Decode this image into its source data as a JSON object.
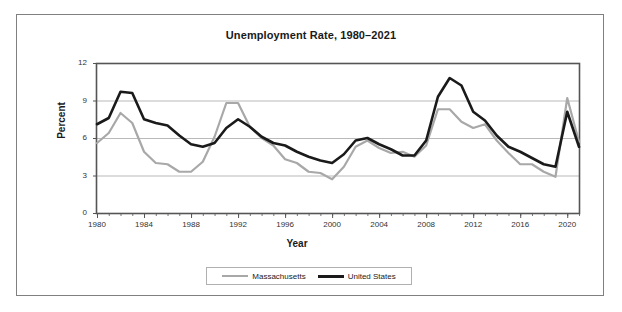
{
  "figure": {
    "title": "Unemployment Rate, 1980–2021",
    "xlabel": "Year",
    "ylabel": "Percent"
  },
  "legend": {
    "entries": [
      {
        "label": "Massachusetts",
        "color": "#a8a8a8"
      },
      {
        "label": "United States",
        "color": "#1a1a1a"
      }
    ]
  },
  "chart_data": {
    "type": "line",
    "title": "Unemployment Rate, 1980–2021",
    "xlabel": "Year",
    "ylabel": "Percent",
    "xlim": [
      1980,
      2021
    ],
    "ylim": [
      0,
      12
    ],
    "yticks": [
      0,
      3,
      6,
      9,
      12
    ],
    "xticks": [
      1980,
      1984,
      1988,
      1992,
      1996,
      2000,
      2004,
      2008,
      2012,
      2016,
      2020
    ],
    "grid": "horizontal",
    "legend_position": "bottom-center",
    "x": [
      1980,
      1981,
      1982,
      1983,
      1984,
      1985,
      1986,
      1987,
      1988,
      1989,
      1990,
      1991,
      1992,
      1993,
      1994,
      1995,
      1996,
      1997,
      1998,
      1999,
      2000,
      2001,
      2002,
      2003,
      2004,
      2005,
      2006,
      2007,
      2008,
      2009,
      2010,
      2011,
      2012,
      2013,
      2014,
      2015,
      2016,
      2017,
      2018,
      2019,
      2020,
      2021
    ],
    "series": [
      {
        "name": "Massachusetts",
        "color": "#a8a8a8",
        "values": [
          5.6,
          6.4,
          8.0,
          7.2,
          4.9,
          4.0,
          3.9,
          3.3,
          3.3,
          4.1,
          6.1,
          8.8,
          8.8,
          6.9,
          6.0,
          5.4,
          4.3,
          4.0,
          3.3,
          3.2,
          2.7,
          3.7,
          5.3,
          5.8,
          5.2,
          4.8,
          4.9,
          4.5,
          5.4,
          8.3,
          8.3,
          7.3,
          6.8,
          7.1,
          5.8,
          4.8,
          3.9,
          3.9,
          3.3,
          2.9,
          9.2,
          5.7
        ]
      },
      {
        "name": "United States",
        "color": "#1a1a1a",
        "values": [
          7.1,
          7.6,
          9.7,
          9.6,
          7.5,
          7.2,
          7.0,
          6.2,
          5.5,
          5.3,
          5.6,
          6.8,
          7.5,
          6.9,
          6.1,
          5.6,
          5.4,
          4.9,
          4.5,
          4.2,
          4.0,
          4.7,
          5.8,
          6.0,
          5.5,
          5.1,
          4.6,
          4.6,
          5.8,
          9.3,
          10.8,
          10.2,
          8.1,
          7.4,
          6.2,
          5.3,
          4.9,
          4.4,
          3.9,
          3.7,
          8.1,
          5.3
        ]
      }
    ]
  }
}
